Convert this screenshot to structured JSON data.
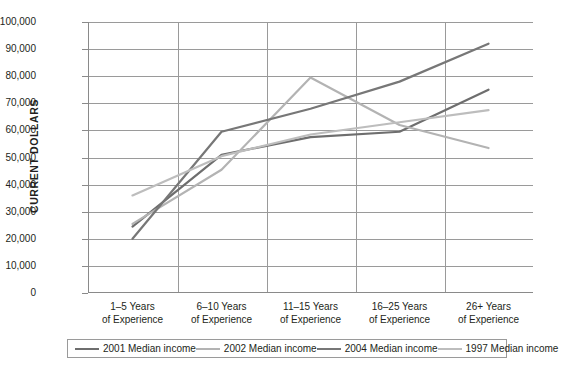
{
  "chart_data": {
    "type": "line",
    "title": "",
    "xlabel": "",
    "ylabel": "CURRENT DOLLARS",
    "ylim": [
      0,
      100000
    ],
    "ytick_step": 10000,
    "grid": true,
    "legend_position": "bottom",
    "categories": [
      "1–5 Years of Experience",
      "6–10 Years of Experience",
      "11–15 Years of Experience",
      "16–25 Years of Experience",
      "26+ Years of Experience"
    ],
    "category_lines": [
      {
        "line1": "1–5 Years",
        "line2": "of Experience"
      },
      {
        "line1": "6–10 Years",
        "line2": "of Experience"
      },
      {
        "line1": "11–15 Years",
        "line2": "of Experience"
      },
      {
        "line1": "16–25 Years",
        "line2": "of Experience"
      },
      {
        "line1": "26+ Years",
        "line2": "of Experience"
      }
    ],
    "ytick_labels": [
      "100,000",
      "90,000",
      "80,000",
      "70,000",
      "60,000",
      "50,000",
      "40,000",
      "30,000",
      "20,000",
      "10,000",
      "0"
    ],
    "ytick_values": [
      100000,
      90000,
      80000,
      70000,
      60000,
      50000,
      40000,
      30000,
      20000,
      10000,
      0
    ],
    "series": [
      {
        "name": "2001 Median income",
        "color": "#6e6e6e",
        "values": [
          24500,
          51000,
          57500,
          59500,
          75000
        ]
      },
      {
        "name": "2002 Median income",
        "color": "#b3b3b3",
        "values": [
          25500,
          45500,
          79500,
          62000,
          53500
        ]
      },
      {
        "name": "2004 Median income",
        "color": "#777777",
        "values": [
          20000,
          59500,
          68000,
          78000,
          92000
        ]
      },
      {
        "name": "1997 Median income",
        "color": "#bdbdbd",
        "values": [
          36000,
          50500,
          58500,
          63000,
          67500
        ]
      }
    ]
  },
  "legend": {
    "items": [
      {
        "label": "2001 Median income",
        "color": "#6e6e6e"
      },
      {
        "label": "2002 Median income",
        "color": "#b3b3b3"
      },
      {
        "label": "2004 Median income",
        "color": "#777777"
      },
      {
        "label": "1997 Median income",
        "color": "#bdbdbd"
      }
    ]
  }
}
